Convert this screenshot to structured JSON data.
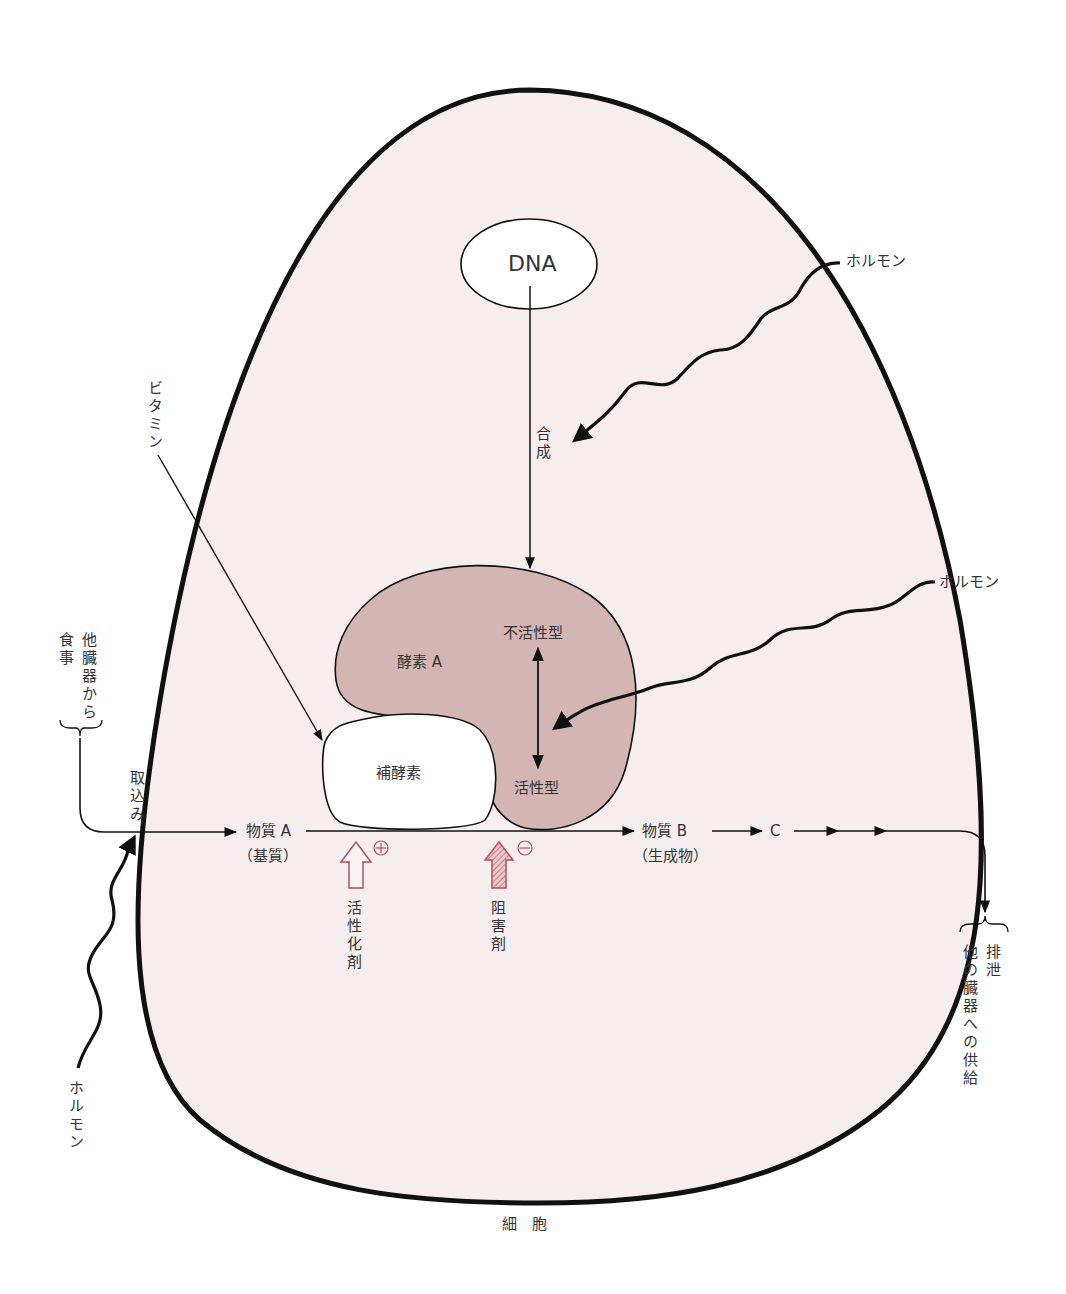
{
  "diagram": {
    "title": "細　胞",
    "colors": {
      "cell_fill": "#f6eeee",
      "cell_outline": "#111111",
      "enzyme_fill": "#d3b6b3",
      "coenzyme_fill": "#ffffff",
      "modifier_red": "#b5505a",
      "line": "#111111"
    },
    "nodes": {
      "dna": "DNA",
      "synthesis": "合成",
      "enzyme": "酵素 A",
      "inactive": "不活性型",
      "active": "活性型",
      "coenzyme": "補酵素",
      "substrate": "物質 A",
      "substrate_note": "（基質）",
      "product": "物質 B",
      "product_note": "（生成物）",
      "c": "C",
      "activator": "活性化剤",
      "activator_sign": "+",
      "inhibitor": "阻害剤",
      "inhibitor_sign": "−"
    },
    "external": {
      "hormone_top": "ホルモン",
      "hormone_mid": "ホルモン",
      "hormone_bottom": "ホルモン",
      "vitamin": "ビタミン",
      "source_food": "食事",
      "source_organs": "他臓器から",
      "uptake": "取込み",
      "excretion": "排泄",
      "supply": "他の臓器への供給"
    }
  }
}
